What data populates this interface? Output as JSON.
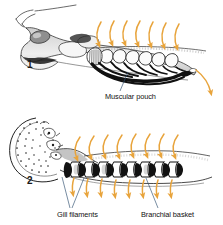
{
  "figure": {
    "background_color": "#ffffff",
    "ink_color": "#1a1a1a",
    "arrow_color": "#e8a43c",
    "leader_color": "#2b4a66",
    "panels": [
      {
        "number": "1",
        "caption": "Lateral view of head and branchial region showing muscular pouch",
        "labels": [
          "Muscular pouch"
        ],
        "flow_arrows_in": 7,
        "flow_arrows_out": 1
      },
      {
        "number": "2",
        "caption": "Oral disc with teeth and branchial basket with gill filaments",
        "labels": [
          "Gill filaments",
          "Branchial basket"
        ],
        "flow_arrows_in": 8,
        "flow_arrows_out": 8
      }
    ]
  },
  "labels": {
    "panel_one_number": "1",
    "panel_two_number": "2",
    "muscular_pouch": "Muscular pouch",
    "gill_filaments": "Gill filaments",
    "branchial_basket": "Branchial basket"
  },
  "colors": {
    "arrow_orange": "#e8a43c",
    "arrow_orange_light": "#f0bb6a",
    "leader_blue": "#2f4f6f",
    "ink_black": "#1a1a1a",
    "shade_gray": "#a8a8a8",
    "shade_light": "#d6d6d6",
    "background": "#ffffff"
  }
}
